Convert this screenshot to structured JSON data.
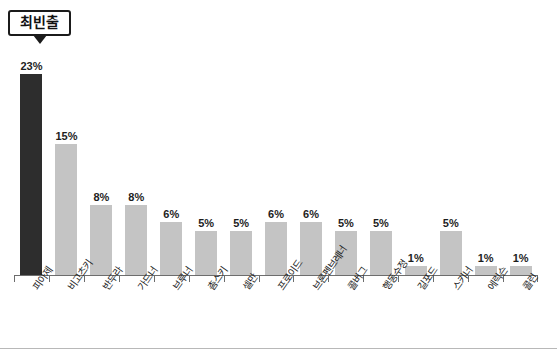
{
  "chart_data": {
    "type": "bar",
    "title": "",
    "xlabel": "",
    "ylabel": "",
    "ylim": [
      0,
      25
    ],
    "grid": false,
    "legend": "none",
    "value_suffix": "%",
    "highlight_index": 0,
    "categories": [
      "피아제",
      "비고츠키",
      "반두라",
      "가드너",
      "브루너",
      "촘스키",
      "셀만",
      "프로이드",
      "브론펜브레너",
      "콜버그",
      "행동수정",
      "길포드",
      "스키너",
      "에릭슨",
      "콜린"
    ],
    "values": [
      23,
      15,
      8,
      8,
      6,
      5,
      5,
      6,
      6,
      5,
      5,
      1,
      5,
      1,
      1
    ],
    "value_labels": [
      "23%",
      "15%",
      "8%",
      "8%",
      "6%",
      "5%",
      "5%",
      "6%",
      "6%",
      "5%",
      "5%",
      "1%",
      "5%",
      "1%",
      "1%"
    ],
    "colors": {
      "highlight_bar": "#2d2d2d",
      "bar": "#c4c4c4",
      "axis": "#6d6d6d",
      "text": "#1d1d1d"
    }
  },
  "callout": {
    "label": "최빈출"
  },
  "title_strip": {
    "text": ""
  }
}
